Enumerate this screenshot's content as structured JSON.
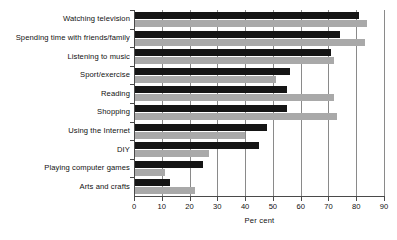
{
  "chart_data": {
    "type": "bar",
    "orientation": "horizontal",
    "title": "",
    "xlabel": "Per cent",
    "ylabel": "",
    "xlim": [
      0,
      90
    ],
    "xticks": [
      0,
      10,
      20,
      30,
      40,
      50,
      60,
      70,
      80,
      90
    ],
    "xtick_labels": [
      "0",
      "10",
      "20",
      "30",
      "40",
      "50",
      "60",
      "70",
      "80",
      "90"
    ],
    "grid": true,
    "grid_axis": "x",
    "legend": "none",
    "categories": [
      "Watching television",
      "Spending time with friends/family",
      "Listening to music",
      "Sport/exercise",
      "Reading",
      "Shopping",
      "Using the Internet",
      "DIY",
      "Playing computer games",
      "Arts and crafts"
    ],
    "series": [
      {
        "name": "series-dark",
        "color": "#151515",
        "values": [
          81,
          74,
          71,
          56,
          55,
          55,
          48,
          45,
          25,
          13
        ]
      },
      {
        "name": "series-light",
        "color": "#a9a9a9",
        "values": [
          84,
          83,
          72,
          51,
          72,
          73,
          40,
          27,
          11,
          22
        ]
      }
    ]
  }
}
